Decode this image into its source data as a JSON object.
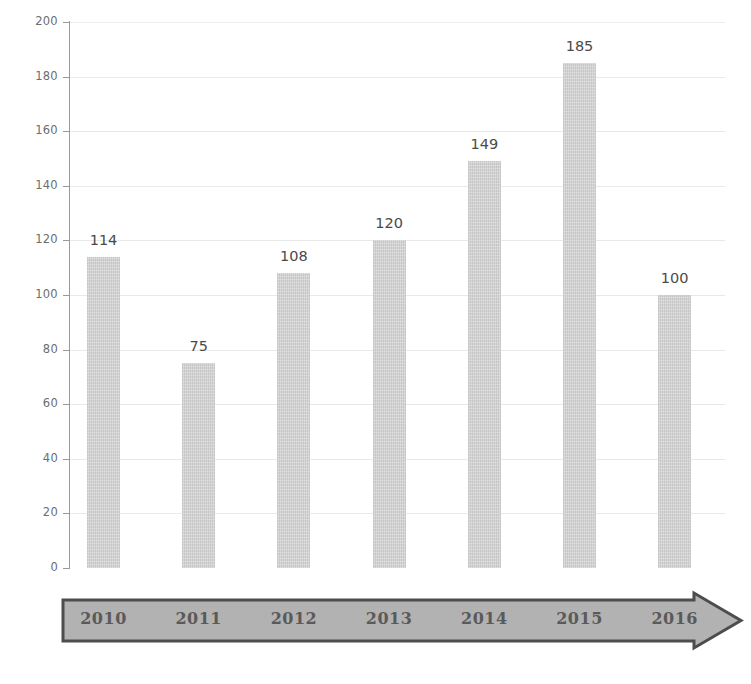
{
  "chart_data": {
    "type": "bar",
    "title": "",
    "subtitle": "",
    "xlabel": "",
    "ylabel": "",
    "categories": [
      "2010",
      "2011",
      "2012",
      "2013",
      "2014",
      "2015",
      "2016"
    ],
    "values": [
      114,
      75,
      108,
      120,
      149,
      185,
      100
    ],
    "series": [
      {
        "name": "",
        "values": [
          114,
          75,
          108,
          120,
          149,
          185,
          100
        ]
      }
    ],
    "ylim": [
      0,
      200
    ],
    "ytick_labels": [
      "0",
      "20",
      "40",
      "60",
      "80",
      "100",
      "120",
      "140",
      "160",
      "180",
      "200"
    ],
    "ytick_values": [
      0,
      20,
      40,
      60,
      80,
      100,
      120,
      140,
      160,
      180,
      200
    ],
    "data_labels": [
      "114",
      "75",
      "108",
      "120",
      "149",
      "185",
      "100"
    ],
    "grid": true,
    "grid_axis": "y",
    "legend": false,
    "legend_position": "none",
    "annotations": [],
    "colors": {
      "bar_fill": "#cdcdcd",
      "grid": "#e9e9e9",
      "axis_line": "#9a9a9a",
      "tick_text": "#6d6d6d",
      "data_label_text": "#4a4a4a",
      "axis_arrow_fill": "#b0b0b0",
      "axis_arrow_stroke": "#4d4d4d",
      "year_label_text": "#5a5a5a",
      "background": "#ffffff"
    },
    "x_axis_style": "arrow"
  }
}
